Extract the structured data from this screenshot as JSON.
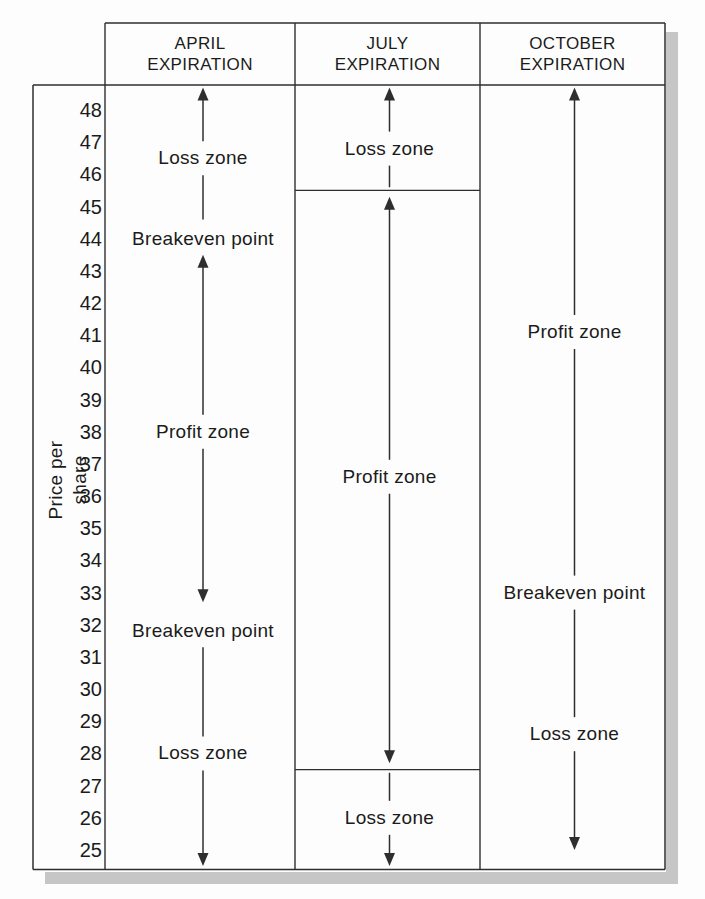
{
  "colors": {
    "line": "#2e2e2e",
    "text": "#1b1b1b",
    "shadow": "#c6c6c6",
    "background": "#fdfdfd"
  },
  "chart_data": {
    "type": "table",
    "ylabel": "Price per share",
    "ylim": [
      24.5,
      48.7
    ],
    "y_ticks": [
      48,
      47,
      46,
      45,
      44,
      43,
      42,
      41,
      40,
      39,
      38,
      37,
      36,
      35,
      34,
      33,
      32,
      31,
      30,
      29,
      28,
      27,
      26,
      25
    ],
    "grid": false,
    "columns": [
      {
        "id": "april",
        "name": "APRIL EXPIRATION",
        "name_lines": [
          "APRIL",
          "EXPIRATION"
        ],
        "dividers": [],
        "zones": [
          {
            "kind": "arrow",
            "from": 48.7,
            "to": 44.6,
            "head_top": true,
            "head_bottom": false,
            "labels": [
              {
                "text": "Loss zone",
                "at": 46.5
              }
            ]
          },
          {
            "kind": "text",
            "labels": [
              {
                "text": "Breakeven point",
                "at": 44.0
              }
            ]
          },
          {
            "kind": "arrow",
            "from": 43.5,
            "to": 32.7,
            "head_top": true,
            "head_bottom": true,
            "labels": [
              {
                "text": "Profit zone",
                "at": 38.0
              }
            ]
          },
          {
            "kind": "text",
            "labels": [
              {
                "text": "Breakeven point",
                "at": 31.8
              }
            ]
          },
          {
            "kind": "arrow",
            "from": 31.3,
            "to": 24.5,
            "head_top": false,
            "head_bottom": true,
            "labels": [
              {
                "text": "Loss zone",
                "at": 28.0
              }
            ]
          }
        ]
      },
      {
        "id": "july",
        "name": "JULY EXPIRATION",
        "name_lines": [
          "JULY",
          "EXPIRATION"
        ],
        "dividers": [
          45.5,
          27.5
        ],
        "zones": [
          {
            "kind": "arrow",
            "from": 48.7,
            "to": 45.6,
            "head_top": true,
            "head_bottom": false,
            "labels": [
              {
                "text": "Loss zone",
                "at": 46.8
              }
            ]
          },
          {
            "kind": "arrow",
            "from": 45.3,
            "to": 27.7,
            "head_top": true,
            "head_bottom": true,
            "labels": [
              {
                "text": "Profit zone",
                "at": 36.6
              }
            ]
          },
          {
            "kind": "arrow",
            "from": 27.4,
            "to": 24.5,
            "head_top": false,
            "head_bottom": true,
            "labels": [
              {
                "text": "Loss zone",
                "at": 26.0
              }
            ]
          }
        ]
      },
      {
        "id": "october",
        "name": "OCTOBER EXPIRATION",
        "name_lines": [
          "OCTOBER",
          "EXPIRATION"
        ],
        "dividers": [],
        "zones": [
          {
            "kind": "arrow",
            "from": 48.7,
            "to": 25.0,
            "head_top": true,
            "head_bottom": true,
            "labels": [
              {
                "text": "Profit zone",
                "at": 41.1
              },
              {
                "text": "Breakeven point",
                "at": 33.0
              },
              {
                "text": "Loss zone",
                "at": 28.6
              }
            ]
          }
        ]
      }
    ]
  }
}
